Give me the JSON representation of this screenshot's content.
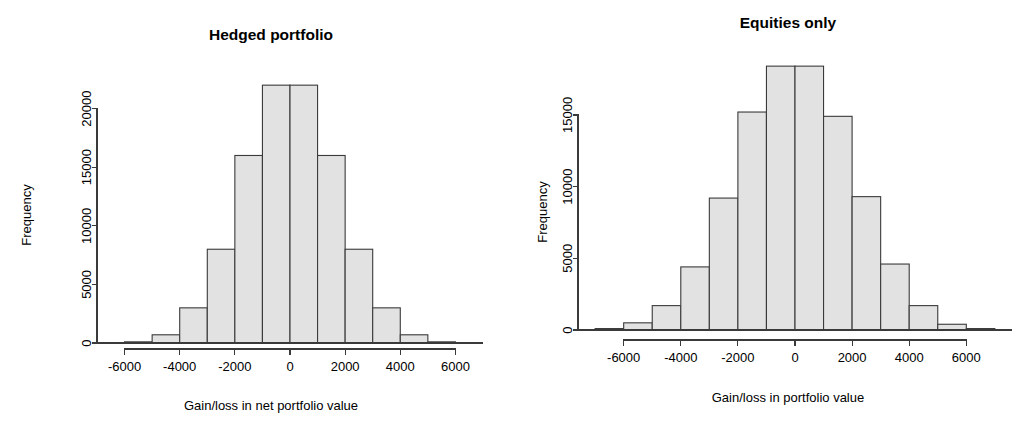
{
  "figure": {
    "background": "#ffffff",
    "bar_fill": "#e2e2e2",
    "bar_stroke": "#3a3a3a",
    "axis_color": "#3a3a3a"
  },
  "chart_data": [
    {
      "type": "bar",
      "panel": "left",
      "title": "Hedged portfolio",
      "xlabel": "Gain/loss in net portfolio value",
      "ylabel": "Frequency",
      "grid": false,
      "legend": false,
      "bin_width": 1000,
      "bin_starts": [
        -6000,
        -5000,
        -4000,
        -3000,
        -2000,
        -1000,
        0,
        1000,
        2000,
        3000,
        4000,
        5000
      ],
      "categories": [
        "-6000",
        "-5000",
        "-4000",
        "-3000",
        "-2000",
        "-1000",
        "0",
        "1000",
        "2000",
        "3000",
        "4000",
        "5000"
      ],
      "values": [
        100,
        700,
        3000,
        8000,
        16000,
        22000,
        22000,
        16000,
        8000,
        3000,
        700,
        100
      ],
      "xlim": [
        -7000,
        7000
      ],
      "ylim": [
        0,
        22600
      ],
      "xticks": [
        -6000,
        -4000,
        -2000,
        0,
        2000,
        4000,
        6000
      ],
      "xtick_labels": [
        "-6000",
        "-4000",
        "-2000",
        "0",
        "2000",
        "4000",
        "6000"
      ],
      "yticks": [
        0,
        5000,
        10000,
        15000,
        20000
      ],
      "ytick_labels": [
        "0",
        "5000",
        "10000",
        "15000",
        "20000"
      ]
    },
    {
      "type": "bar",
      "panel": "right",
      "title": "Equities only",
      "xlabel": "Gain/loss in portfolio value",
      "ylabel": "Frequency",
      "grid": false,
      "legend": false,
      "bin_width": 1000,
      "bin_starts": [
        -7000,
        -6000,
        -5000,
        -4000,
        -3000,
        -2000,
        -1000,
        0,
        1000,
        2000,
        3000,
        4000,
        5000,
        6000
      ],
      "categories": [
        "-7000",
        "-6000",
        "-5000",
        "-4000",
        "-3000",
        "-2000",
        "-1000",
        "0",
        "1000",
        "2000",
        "3000",
        "4000",
        "5000",
        "6000"
      ],
      "values": [
        100,
        500,
        1700,
        4400,
        9200,
        15200,
        18400,
        18400,
        14900,
        9300,
        4600,
        1700,
        400,
        100
      ],
      "xlim": [
        -7600,
        7600
      ],
      "ylim": [
        0,
        18700
      ],
      "xticks": [
        -6000,
        -4000,
        -2000,
        0,
        2000,
        4000,
        6000
      ],
      "xtick_labels": [
        "-6000",
        "-4000",
        "-2000",
        "0",
        "2000",
        "4000",
        "6000"
      ],
      "yticks": [
        0,
        5000,
        10000,
        15000
      ],
      "ytick_labels": [
        "0",
        "5000",
        "10000",
        "15000"
      ]
    }
  ]
}
